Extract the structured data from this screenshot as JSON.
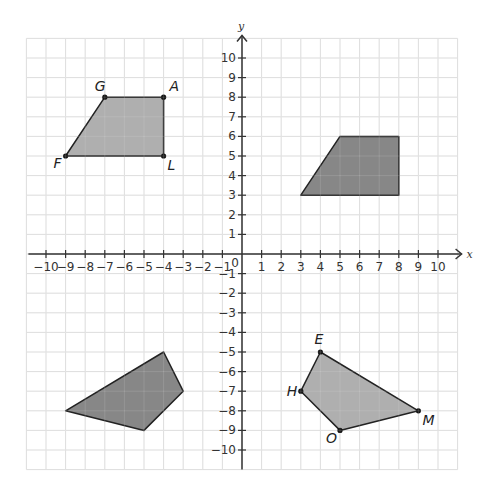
{
  "plane": {
    "x_axis_label": "x",
    "y_axis_label": "y",
    "origin_label": "0",
    "x_range": [
      -10,
      10
    ],
    "y_range": [
      -10,
      10
    ],
    "grid_extent": [
      -11,
      11
    ],
    "x_ticks": [
      "-10",
      "-9",
      "-8",
      "-7",
      "-6",
      "-5",
      "-4",
      "-3",
      "-2",
      "-1",
      "1",
      "2",
      "3",
      "4",
      "5",
      "6",
      "7",
      "8",
      "9",
      "10"
    ],
    "y_ticks": [
      "10",
      "9",
      "8",
      "7",
      "6",
      "5",
      "4",
      "3",
      "2",
      "1",
      "-1",
      "-2",
      "-3",
      "-4",
      "-5",
      "-6",
      "-7",
      "-8",
      "-9",
      "-10"
    ]
  },
  "colors": {
    "grid": "#d9d9d9",
    "axis": "#333333",
    "shape_light": "#a6a6a6",
    "shape_dark": "#7a7a7a",
    "outline": "#222222"
  },
  "shapes": [
    {
      "name": "FGAL",
      "fill": "light",
      "labeled": true,
      "vertices": [
        {
          "label": "F",
          "x": -9,
          "y": 5
        },
        {
          "label": "G",
          "x": -7,
          "y": 8
        },
        {
          "label": "A",
          "x": -4,
          "y": 8
        },
        {
          "label": "L",
          "x": -4,
          "y": 5
        }
      ]
    },
    {
      "name": "quadrant-I-image",
      "fill": "dark",
      "labeled": false,
      "vertices": [
        {
          "x": 3,
          "y": 3
        },
        {
          "x": 5,
          "y": 6
        },
        {
          "x": 8,
          "y": 6
        },
        {
          "x": 8,
          "y": 3
        }
      ]
    },
    {
      "name": "quadrant-III-image",
      "fill": "dark",
      "labeled": false,
      "vertices": [
        {
          "x": -9,
          "y": -8
        },
        {
          "x": -4,
          "y": -5
        },
        {
          "x": -3,
          "y": -7
        },
        {
          "x": -5,
          "y": -9
        }
      ]
    },
    {
      "name": "EHOM",
      "fill": "light",
      "labeled": true,
      "vertices": [
        {
          "label": "E",
          "x": 4,
          "y": -5
        },
        {
          "label": "H",
          "x": 3,
          "y": -7
        },
        {
          "label": "O",
          "x": 5,
          "y": -9
        },
        {
          "label": "M",
          "x": 9,
          "y": -8
        }
      ]
    }
  ]
}
